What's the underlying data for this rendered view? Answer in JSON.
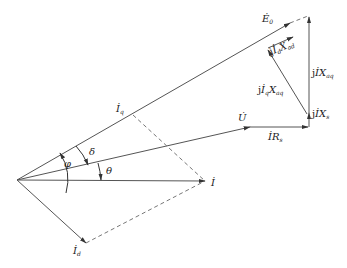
{
  "diagram": {
    "colors": {
      "line": "#555555",
      "dashed": "#777777",
      "text": "#222222",
      "background": "#ffffff"
    },
    "labels": {
      "E0": {
        "base": "Ė",
        "sub": "0"
      },
      "jIdXad": {
        "prefix": "j",
        "base": "İ",
        "sub": "d",
        "tail": "X",
        "tailsub": "ad"
      },
      "jIXaq": {
        "prefix": "j",
        "base": "İ",
        "tail": "X",
        "tailsub": "aq"
      },
      "jIqXaq": {
        "prefix": "j",
        "base": "İ",
        "sub": "q",
        "tail": "X",
        "tailsub": "aq"
      },
      "jIXs": {
        "prefix": "j",
        "base": "İ",
        "tail": "X",
        "tailsub": "s"
      },
      "IRs": {
        "base": "İ",
        "tail": "R",
        "tailsub": "s"
      },
      "U": {
        "base": "U̇"
      },
      "I": {
        "base": "İ"
      },
      "Iq": {
        "base": "İ",
        "sub": "q"
      },
      "Id": {
        "base": "İ",
        "sub": "d"
      },
      "phi": "φ",
      "delta": "δ",
      "theta": "θ"
    }
  }
}
